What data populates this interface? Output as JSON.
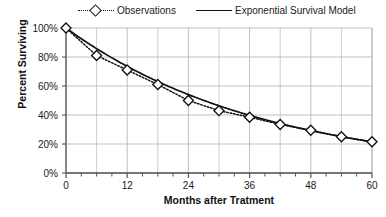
{
  "chart_data": {
    "type": "line",
    "title": "",
    "xlabel": "Months after Tratment",
    "ylabel": "Percent Surviving",
    "xlim": [
      0,
      60
    ],
    "ylim": [
      0,
      100
    ],
    "grid": true,
    "legend_position": "top",
    "x_ticks": [
      "0",
      "12",
      "24",
      "36",
      "48",
      "60"
    ],
    "x_tick_values": [
      0,
      12,
      24,
      36,
      48,
      60
    ],
    "x_minor_tick_interval": 3,
    "y_ticks": [
      "0%",
      "20%",
      "40%",
      "60%",
      "80%",
      "100%"
    ],
    "y_tick_values": [
      0,
      20,
      40,
      60,
      80,
      100
    ],
    "x": [
      0,
      6,
      12,
      18,
      24,
      30,
      36,
      42,
      48,
      54,
      60
    ],
    "series": [
      {
        "name": "Observations",
        "style": "dotted-with-diamond-markers",
        "color": "#111111",
        "values": [
          100,
          81,
          71,
          61,
          50,
          43,
          38.5,
          33.5,
          29.5,
          25,
          21.5
        ]
      },
      {
        "name": "Exponential Survival Model",
        "style": "solid-line",
        "color": "#111111",
        "values": [
          100,
          85.8,
          73.5,
          63.1,
          54.1,
          46.4,
          39.8,
          34.2,
          29.3,
          25.1,
          21.5
        ]
      }
    ]
  },
  "legend": {
    "items": [
      {
        "label": "Observations"
      },
      {
        "label": "Exponential Survival Model"
      }
    ]
  },
  "axes": {
    "y_title": "Percent Surviving",
    "x_title": "Months after Tratment"
  },
  "colors": {
    "line": "#111111",
    "grid": "#b8b8b8",
    "axis": "#555555",
    "text": "#1a1a1a",
    "background": "#ffffff"
  }
}
